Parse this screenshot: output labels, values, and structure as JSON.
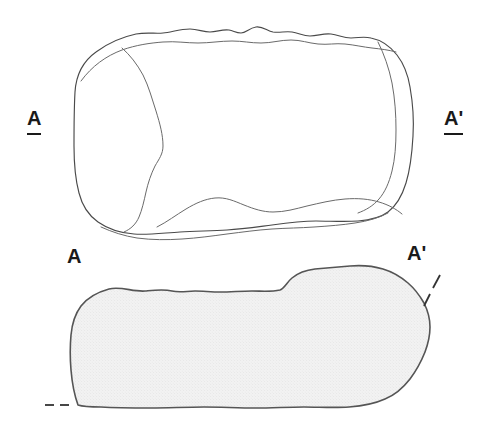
{
  "figure": {
    "kind": "archaeological-line-drawing",
    "background_color": "#ffffff",
    "line_color": "#4a4a4a",
    "section_fill_color": "#efefef",
    "section_stroke_color": "#555555",
    "label_color": "#1a1a1a"
  },
  "labels": {
    "plan_left": "A",
    "plan_right": "A'",
    "section_left": "A",
    "section_right": "A'"
  },
  "views": {
    "plan": {
      "name": "plan-view",
      "has_fill": false,
      "stroke_count": 4
    },
    "section": {
      "name": "cross-section-view",
      "has_fill": true,
      "fill_pattern": "fine-stipple",
      "cut_markers": 2
    }
  },
  "markers": {
    "section_line_top_left": "A",
    "section_line_top_right": "A'",
    "section_cut_dash_left": "dashed-tick",
    "section_cut_dash_right": "dashed-tick"
  }
}
